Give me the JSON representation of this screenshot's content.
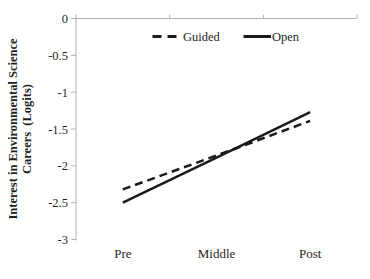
{
  "chart_data": {
    "type": "line",
    "title": "",
    "categories": [
      "Pre",
      "Middle",
      "Post"
    ],
    "series": [
      {
        "name": "Guided",
        "style": "dashed",
        "values": [
          -2.32,
          -1.86,
          -1.39
        ]
      },
      {
        "name": "Open",
        "style": "solid",
        "values": [
          -2.5,
          -1.89,
          -1.27
        ]
      }
    ],
    "ylabel_line1": "Interest in Environmental Science",
    "ylabel_line2": "Careers  (Logits)",
    "ytick_labels": [
      "0",
      "-0.5",
      "-1",
      "-1.5",
      "-2",
      "-2.5",
      "-3"
    ],
    "yticks": [
      0,
      -0.5,
      -1,
      -1.5,
      -2,
      -2.5,
      -3
    ],
    "ylim": [
      -3,
      0
    ],
    "grid": false,
    "legend_position": "top-inside",
    "colors": {
      "line": "#1a1a1a",
      "axis": "#b3b3b3",
      "text": "#1f1f1f",
      "background": "#ffffff"
    }
  }
}
